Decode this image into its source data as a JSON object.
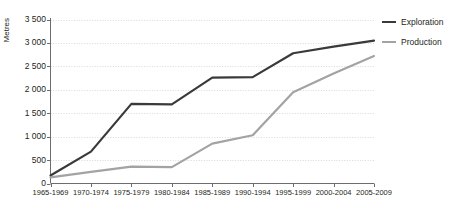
{
  "chart_data": {
    "type": "line",
    "title": "",
    "xlabel": "",
    "ylabel": "Metres",
    "categories": [
      "1965-1969",
      "1970-1974",
      "1975-1979",
      "1980-1984",
      "1985-1989",
      "1990-1994",
      "1995-1999",
      "2000-2004",
      "2005-2009"
    ],
    "yticks": [
      "0",
      "500",
      "1 000",
      "1 500",
      "2 000",
      "2 500",
      "3 000",
      "3 500"
    ],
    "ytick_values": [
      0,
      500,
      1000,
      1500,
      2000,
      2500,
      3000,
      3500
    ],
    "ylim": [
      0,
      3500
    ],
    "grid": true,
    "legend_position": "right-top",
    "series": [
      {
        "name": "Exploration",
        "color": "#3a3a3a",
        "values": [
          170,
          680,
          1700,
          1690,
          2260,
          2270,
          2780,
          2920,
          3050
        ]
      },
      {
        "name": "Production",
        "color": "#a3a3a3",
        "values": [
          130,
          250,
          360,
          350,
          850,
          1030,
          1950,
          2350,
          2720
        ]
      }
    ]
  },
  "legend": {
    "items": [
      {
        "label": "Exploration"
      },
      {
        "label": "Production"
      }
    ]
  },
  "colors": {
    "exploration": "#3a3a3a",
    "production": "#a3a3a3",
    "grid": "#d9d9d9",
    "axis": "#6d6d6d",
    "text": "#231f20",
    "background": "#ffffff"
  }
}
